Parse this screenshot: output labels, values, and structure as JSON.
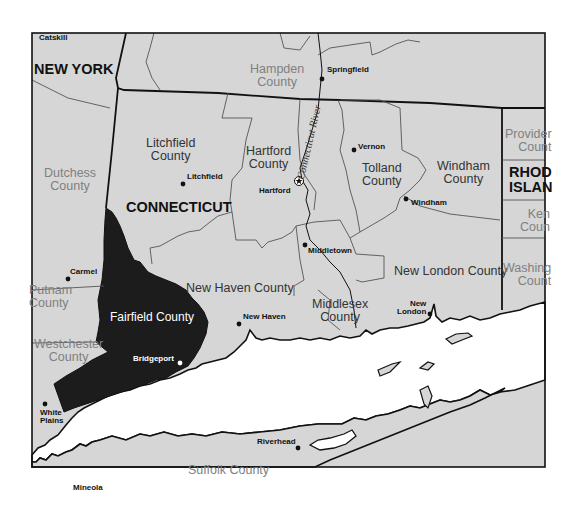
{
  "map": {
    "colors": {
      "land": "#d6d6d6",
      "water": "#ffffff",
      "highlight": "#1c1c1c",
      "border": "#111111",
      "county_line": "#444444"
    },
    "states": {
      "new_york": "NEW YORK",
      "connecticut": "CONNECTICUT",
      "rhode_island_line1": "RHOD",
      "rhode_island_line2": "ISLAN"
    },
    "counties": {
      "litchfield": [
        "Litchfield",
        "County"
      ],
      "hartford": [
        "Hartford",
        "County"
      ],
      "tolland": [
        "Tolland",
        "County"
      ],
      "windham": [
        "Windham",
        "County"
      ],
      "new_haven": "New Haven County",
      "new_london": "New London County",
      "middlesex": [
        "Middlesex",
        "County"
      ],
      "fairfield": "Fairfield County",
      "hampden": [
        "Hampden",
        "County"
      ],
      "dutchess": [
        "Dutchess",
        "County"
      ],
      "putnam": [
        "Putnam",
        "County"
      ],
      "westchester": [
        "Westchester",
        "County"
      ],
      "suffolk": "Suffolk County",
      "providence": [
        "Provider",
        "Count"
      ],
      "kent": [
        "Ken",
        "Coun"
      ],
      "washington": [
        "Washing",
        "Count"
      ]
    },
    "cities": {
      "catskill": "Catskill",
      "springfield": "Springfield",
      "litchfield": "Litchfield",
      "hartford": "Hartford",
      "vernon": "Vernon",
      "windham": "Windham",
      "middletown": "Middletown",
      "carmel": "Carmel",
      "new_haven": "New Haven",
      "new_london_line1": "New",
      "new_london_line2": "London",
      "bridgeport": "Bridgeport",
      "white_plains_line1": "White",
      "white_plains_line2": "Plains",
      "riverhead": "Riverhead",
      "mineola": "Mineola"
    },
    "river": "Connecticut River",
    "highlighted_county": "Fairfield County"
  }
}
